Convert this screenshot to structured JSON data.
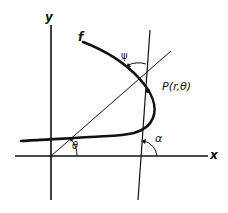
{
  "diagram": {
    "type": "polar-curve-tangent",
    "labels": {
      "y_axis": "y",
      "x_axis": "x",
      "curve": "f",
      "point": "P(r,θ)",
      "psi": "ψ",
      "theta": "θ",
      "alpha": "α"
    },
    "colors": {
      "ink": "#111111",
      "background": "#ffffff"
    }
  }
}
